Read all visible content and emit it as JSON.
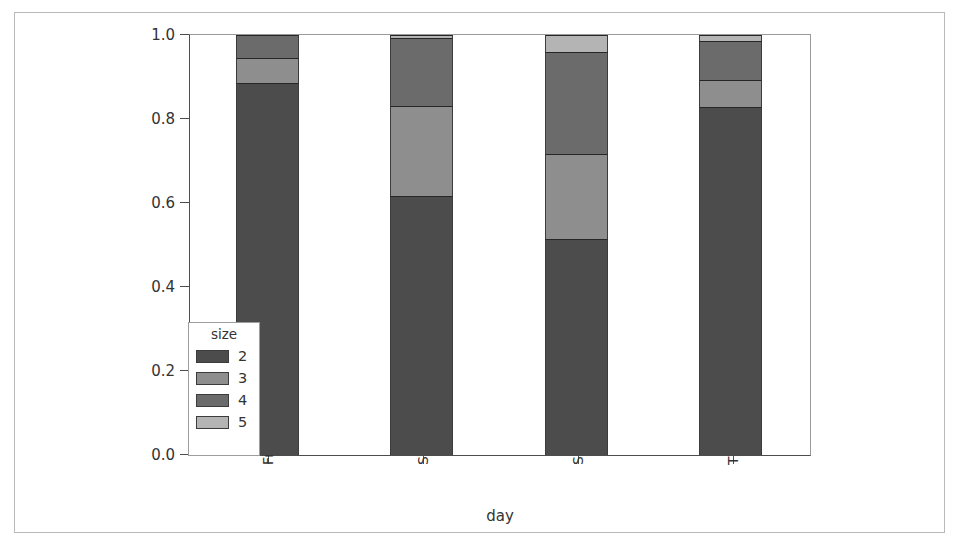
{
  "chart_data": {
    "type": "bar",
    "subtype": "stacked-100-percent",
    "title": "",
    "xlabel": "day",
    "ylabel": "",
    "categories": [
      "Fri",
      "Sat",
      "Sun",
      "Thur"
    ],
    "ylim": [
      0.0,
      1.0
    ],
    "ytick_labels": [
      "0.0",
      "0.2",
      "0.4",
      "0.6",
      "0.8",
      "1.0"
    ],
    "ytick_values": [
      0.0,
      0.2,
      0.4,
      0.6,
      0.8,
      1.0
    ],
    "grid": false,
    "legend_title": "size",
    "legend_position": "lower left (inside axes)",
    "series": [
      {
        "name": "2",
        "color": "#4c4c4c",
        "values": [
          0.885,
          0.617,
          0.514,
          0.829
        ]
      },
      {
        "name": "3",
        "color": "#8e8e8e",
        "values": [
          0.06,
          0.213,
          0.202,
          0.063
        ]
      },
      {
        "name": "4",
        "color": "#6b6b6b",
        "values": [
          0.055,
          0.162,
          0.243,
          0.093
        ]
      },
      {
        "name": "5",
        "color": "#b4b4b4",
        "values": [
          0.0,
          0.008,
          0.041,
          0.015
        ]
      }
    ],
    "cumulative_boundaries": {
      "Fri": [
        0.885,
        0.945,
        1.0,
        1.0
      ],
      "Sat": [
        0.617,
        0.83,
        0.992,
        1.0
      ],
      "Sun": [
        0.514,
        0.716,
        0.959,
        1.0
      ],
      "Thur": [
        0.829,
        0.892,
        0.985,
        1.0
      ]
    }
  },
  "legend": {
    "title": "size",
    "entries": [
      {
        "label": "2",
        "color": "#4c4c4c"
      },
      {
        "label": "3",
        "color": "#8e8e8e"
      },
      {
        "label": "4",
        "color": "#6b6b6b"
      },
      {
        "label": "5",
        "color": "#b4b4b4"
      }
    ]
  },
  "axes": {
    "x_label": "day",
    "x_ticks": [
      "Fri",
      "Sat",
      "Sun",
      "Thur"
    ],
    "y_ticks": [
      "0.0",
      "0.2",
      "0.4",
      "0.6",
      "0.8",
      "1.0"
    ]
  },
  "colors": {
    "axis": "#4d4d4d",
    "frame": "#b9b9b9",
    "background": "#ffffff",
    "segment_edge": "#262626"
  }
}
